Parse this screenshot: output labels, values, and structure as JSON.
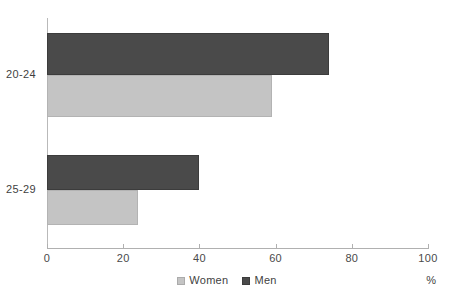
{
  "chart_data": {
    "type": "bar",
    "orientation": "horizontal",
    "title": "",
    "subtitle": "",
    "xlabel": "%",
    "ylabel": "",
    "xlim": [
      0,
      100
    ],
    "xticks": [
      0,
      20,
      40,
      60,
      80,
      100
    ],
    "xtick_labels": [
      "0",
      "20",
      "40",
      "60",
      "80",
      "100"
    ],
    "grid": false,
    "legend_position": "bottom-center",
    "categories": [
      "20-24",
      "25-29"
    ],
    "series": [
      {
        "name": "Women",
        "color": "#c4c4c4",
        "values": [
          59,
          24
        ]
      },
      {
        "name": "Men",
        "color": "#4a4a4a",
        "values": [
          74,
          40
        ]
      }
    ]
  },
  "legend": {
    "items": [
      {
        "label": "Women",
        "swatch_class": "women"
      },
      {
        "label": "Men",
        "swatch_class": "men"
      }
    ]
  },
  "axis": {
    "unit": "%"
  },
  "colors": {
    "men": "#4a4a4a",
    "women": "#c4c4c4",
    "axis": "#b0b0b0",
    "text": "#3f3f3f",
    "background": "#ffffff"
  }
}
